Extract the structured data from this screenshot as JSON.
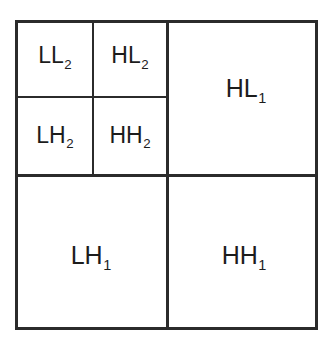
{
  "diagram": {
    "type": "wavelet-subband-decomposition",
    "levels": 2,
    "colors": {
      "line": "#2b2b2b",
      "text": "#1c1c1c",
      "background": "#ffffff"
    },
    "subbands": [
      {
        "id": "ll2",
        "base": "LL",
        "level": "2",
        "level_group": 2,
        "position": "top-left-inner"
      },
      {
        "id": "hl2",
        "base": "HL",
        "level": "2",
        "level_group": 2,
        "position": "top-right-inner"
      },
      {
        "id": "lh2",
        "base": "LH",
        "level": "2",
        "level_group": 2,
        "position": "bottom-left-inner"
      },
      {
        "id": "hh2",
        "base": "HH",
        "level": "2",
        "level_group": 2,
        "position": "bottom-right-inner"
      },
      {
        "id": "hl1",
        "base": "HL",
        "level": "1",
        "level_group": 1,
        "position": "top-right"
      },
      {
        "id": "lh1",
        "base": "LH",
        "level": "1",
        "level_group": 1,
        "position": "bottom-left"
      },
      {
        "id": "hh1",
        "base": "HH",
        "level": "1",
        "level_group": 1,
        "position": "bottom-right"
      }
    ]
  }
}
